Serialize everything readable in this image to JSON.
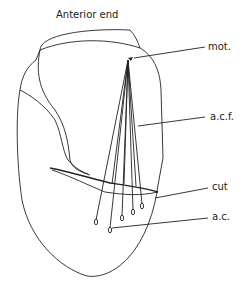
{
  "diagram": {
    "title": "Anterior end",
    "labels": [
      {
        "id": "mot",
        "text": "mot.",
        "x": 208,
        "y": 50
      },
      {
        "id": "acf",
        "text": "a.c.f.",
        "x": 210,
        "y": 120
      },
      {
        "id": "cut",
        "text": "cut",
        "x": 212,
        "y": 190
      },
      {
        "id": "ac",
        "text": "a.c.",
        "x": 212,
        "y": 220
      }
    ],
    "stroke_color": "#222222",
    "background_color": "#ffffff"
  }
}
